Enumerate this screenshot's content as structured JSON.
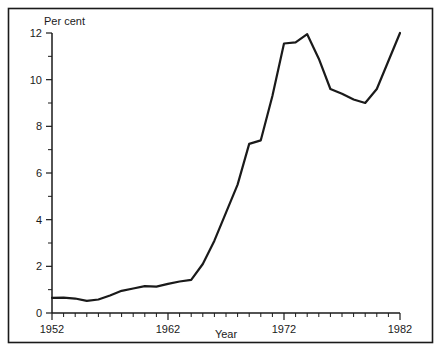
{
  "chart_data": {
    "type": "line",
    "title": "",
    "xlabel": "Year",
    "ylabel": "Per cent",
    "xlim": [
      1952,
      1982
    ],
    "ylim": [
      0,
      12
    ],
    "grid": false,
    "legend": null,
    "x_tick_labels": [
      "1952",
      "1962",
      "1972",
      "1982"
    ],
    "x_major_ticks": [
      1952,
      1962,
      1972,
      1982
    ],
    "x_minor_tick_step": 1,
    "y_tick_labels": [
      "0",
      "2",
      "4",
      "6",
      "8",
      "10",
      "12"
    ],
    "y_major_ticks": [
      0,
      2,
      4,
      6,
      8,
      10,
      12
    ],
    "y_minor_ticks": [
      1,
      3,
      5,
      7,
      9,
      11
    ],
    "series": [
      {
        "name": "Per cent",
        "x": [
          1952,
          1953,
          1954,
          1955,
          1956,
          1957,
          1958,
          1959,
          1960,
          1961,
          1962,
          1963,
          1964,
          1965,
          1966,
          1967,
          1968,
          1969,
          1970,
          1971,
          1972,
          1973,
          1974,
          1975,
          1976,
          1977,
          1978,
          1979,
          1980,
          1981,
          1982
        ],
        "values": [
          0.65,
          0.66,
          0.62,
          0.52,
          0.58,
          0.75,
          0.95,
          1.05,
          1.15,
          1.13,
          1.25,
          1.35,
          1.42,
          2.1,
          3.1,
          4.3,
          5.5,
          7.25,
          7.4,
          9.3,
          11.55,
          11.6,
          11.95,
          10.9,
          9.6,
          9.4,
          9.15,
          9.0,
          9.6,
          10.8,
          12.0
        ]
      }
    ]
  },
  "labels": {
    "y_axis_caption": "Per cent",
    "x_axis_caption": "Year"
  }
}
